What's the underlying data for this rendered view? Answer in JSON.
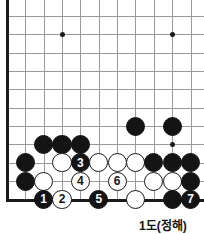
{
  "diagram": {
    "caption": "1도(정해)",
    "caption_x": 139,
    "caption_y": 216,
    "colors": {
      "black_stone": "#141414",
      "white_stone": "#ffffff",
      "grid_line": "#9a9a9a",
      "edge_line": "#1a1a1a",
      "background": "#ffffff"
    },
    "board": {
      "origin_x": 7,
      "origin_y": 16,
      "spacing": 18.35,
      "cols": 11,
      "rows": 11,
      "left_edge": true,
      "bottom_edge": true,
      "stone_radius": 9.6
    },
    "hoshi": [
      {
        "col": 3,
        "row": 1,
        "name": "star-point-upper-left"
      },
      {
        "col": 9,
        "row": 1,
        "name": "star-point-upper-right"
      },
      {
        "col": 9,
        "row": 7,
        "name": "star-point-lower-right"
      }
    ],
    "stones": [
      {
        "col": 7,
        "row": 6,
        "color": "black",
        "label": "",
        "name": "stone-black-c7r6"
      },
      {
        "col": 9,
        "row": 6,
        "color": "black",
        "label": "",
        "name": "stone-black-c9r6"
      },
      {
        "col": 2,
        "row": 7,
        "color": "black",
        "label": "",
        "name": "stone-black-c2r7"
      },
      {
        "col": 3,
        "row": 7,
        "color": "black",
        "label": "",
        "name": "stone-black-c3r7"
      },
      {
        "col": 4,
        "row": 7,
        "color": "black",
        "label": "",
        "name": "stone-black-c4r7"
      },
      {
        "col": 1,
        "row": 8,
        "color": "black",
        "label": "",
        "name": "stone-black-c1r8"
      },
      {
        "col": 3,
        "row": 8,
        "color": "white",
        "label": "",
        "name": "stone-white-c3r8"
      },
      {
        "col": 4,
        "row": 8,
        "color": "black",
        "label": "3",
        "name": "stone-black-move-3"
      },
      {
        "col": 5,
        "row": 8,
        "color": "white",
        "label": "",
        "name": "stone-white-c5r8"
      },
      {
        "col": 6,
        "row": 8,
        "color": "white",
        "label": "",
        "name": "stone-white-c6r8"
      },
      {
        "col": 7,
        "row": 8,
        "color": "white",
        "label": "",
        "name": "stone-white-c7r8"
      },
      {
        "col": 8,
        "row": 8,
        "color": "black",
        "label": "",
        "name": "stone-black-c8r8"
      },
      {
        "col": 9,
        "row": 8,
        "color": "black",
        "label": "",
        "name": "stone-black-c9r8"
      },
      {
        "col": 10,
        "row": 8,
        "color": "black",
        "label": "",
        "name": "stone-black-c10r8"
      },
      {
        "col": 1,
        "row": 9,
        "color": "black",
        "label": "",
        "name": "stone-black-c1r9"
      },
      {
        "col": 2,
        "row": 9,
        "color": "white",
        "label": "",
        "name": "stone-white-c2r9"
      },
      {
        "col": 4,
        "row": 9,
        "color": "white",
        "label": "4",
        "name": "stone-white-move-4"
      },
      {
        "col": 6,
        "row": 9,
        "color": "white",
        "label": "6",
        "name": "stone-white-move-6"
      },
      {
        "col": 8,
        "row": 9,
        "color": "white",
        "label": "",
        "name": "stone-white-c8r9"
      },
      {
        "col": 9,
        "row": 9,
        "color": "white",
        "label": "",
        "name": "stone-white-c9r9"
      },
      {
        "col": 10,
        "row": 9,
        "color": "black",
        "label": "",
        "name": "stone-black-c10r9"
      },
      {
        "col": 2,
        "row": 10,
        "color": "black",
        "label": "1",
        "name": "stone-black-move-1"
      },
      {
        "col": 3,
        "row": 10,
        "color": "white",
        "label": "2",
        "name": "stone-white-move-2"
      },
      {
        "col": 5,
        "row": 10,
        "color": "black",
        "label": "5",
        "name": "stone-black-move-5"
      },
      {
        "col": 7,
        "row": 10,
        "color": "white",
        "label": "",
        "name": "stone-white-c7r10"
      },
      {
        "col": 9,
        "row": 10,
        "color": "black",
        "label": "",
        "name": "stone-black-c9r10"
      },
      {
        "col": 10,
        "row": 10,
        "color": "black",
        "label": "7",
        "name": "stone-black-move-7"
      }
    ]
  }
}
